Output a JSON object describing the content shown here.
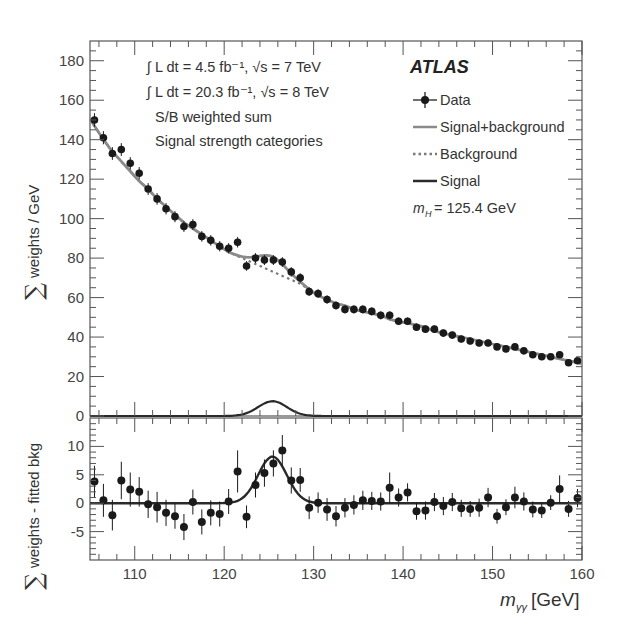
{
  "chart_data": [
    {
      "type": "scatter",
      "panel": "main",
      "title": "",
      "xlabel": "m_γγ [GeV]",
      "ylabel": "∑ weights / GeV",
      "xlim": [
        105,
        160
      ],
      "ylim": [
        0,
        190
      ],
      "yticks": [
        0,
        20,
        40,
        60,
        80,
        100,
        120,
        140,
        160,
        180
      ],
      "xticks": [
        110,
        120,
        130,
        140,
        150,
        160
      ],
      "grid": false,
      "annotations": [
        "∫ L dt = 4.5 fb⁻¹, √s = 7 TeV",
        "∫ L dt = 20.3 fb⁻¹, √s = 8 TeV",
        "S/B weighted sum",
        "Signal strength categories",
        "ATLAS",
        "m_H = 125.4 GeV"
      ],
      "legend": [
        "Data",
        "Signal+background",
        "Background",
        "Signal"
      ],
      "legend_position": "upper right",
      "x": [
        105.5,
        106.5,
        107.5,
        108.5,
        109.5,
        110.5,
        111.5,
        112.5,
        113.5,
        114.5,
        115.5,
        116.5,
        117.5,
        118.5,
        119.5,
        120.5,
        121.5,
        122.5,
        123.5,
        124.5,
        125.5,
        126.5,
        127.5,
        128.5,
        129.5,
        130.5,
        131.5,
        132.5,
        133.5,
        134.5,
        135.5,
        136.5,
        137.5,
        138.5,
        139.5,
        140.5,
        141.5,
        142.5,
        143.5,
        144.5,
        145.5,
        146.5,
        147.5,
        148.5,
        149.5,
        150.5,
        151.5,
        152.5,
        153.5,
        154.5,
        155.5,
        156.5,
        157.5,
        158.5,
        159.5
      ],
      "series": [
        {
          "name": "Data",
          "values": [
            150,
            141,
            133,
            135,
            128,
            123,
            115,
            110,
            105,
            101,
            96,
            97,
            91,
            89,
            86,
            85,
            88,
            76,
            80,
            79,
            79,
            78,
            73,
            70,
            63,
            62,
            59,
            56,
            54,
            54,
            54,
            53,
            51,
            51,
            48,
            48,
            45,
            44,
            44,
            42,
            41,
            39,
            38,
            37,
            37,
            35,
            34,
            35,
            33,
            31,
            30,
            30,
            31,
            27,
            28
          ]
        },
        {
          "name": "Signal+background",
          "values": [
            147,
            140,
            134,
            129,
            124,
            119,
            115,
            110,
            106,
            102,
            98,
            95,
            92,
            89,
            86,
            83,
            81,
            80,
            80,
            80,
            80,
            80,
            77,
            72,
            64,
            61,
            59,
            57,
            56,
            54,
            53,
            52,
            51,
            49,
            48,
            47,
            46,
            45,
            43,
            42,
            41,
            40,
            39,
            38,
            37,
            36,
            35,
            34,
            33,
            32,
            31,
            30,
            29,
            28,
            27
          ]
        },
        {
          "name": "Background",
          "values": [
            147,
            140,
            134,
            129,
            124,
            119,
            115,
            110,
            106,
            102,
            98,
            95,
            92,
            89,
            86,
            83,
            81,
            79,
            77,
            75,
            73,
            71,
            69,
            67,
            64,
            61,
            59,
            57,
            56,
            54,
            53,
            52,
            51,
            49,
            48,
            47,
            46,
            45,
            43,
            42,
            41,
            40,
            39,
            38,
            37,
            36,
            35,
            34,
            33,
            32,
            31,
            30,
            29,
            28,
            27
          ]
        },
        {
          "name": "Signal",
          "values": [
            0,
            0,
            0,
            0,
            0,
            0,
            0,
            0,
            0,
            0,
            0,
            0,
            0,
            0,
            0,
            0,
            0.1,
            0.5,
            2,
            5,
            7.5,
            6.5,
            3,
            0.8,
            0.1,
            0,
            0,
            0,
            0,
            0,
            0,
            0,
            0,
            0,
            0,
            0,
            0,
            0,
            0,
            0,
            0,
            0,
            0,
            0,
            0,
            0,
            0,
            0,
            0,
            0,
            0,
            0,
            0,
            0,
            0
          ]
        }
      ]
    },
    {
      "type": "scatter",
      "panel": "residual",
      "xlabel": "m_γγ [GeV]",
      "ylabel": "∑ weights - fitted bkg",
      "xlim": [
        105,
        160
      ],
      "ylim": [
        -10,
        15
      ],
      "yticks": [
        -5,
        0,
        5,
        10
      ],
      "xticks": [
        110,
        120,
        130,
        140,
        150,
        160
      ],
      "x": [
        105.5,
        106.5,
        107.5,
        108.5,
        109.5,
        110.5,
        111.5,
        112.5,
        113.5,
        114.5,
        115.5,
        116.5,
        117.5,
        118.5,
        119.5,
        120.5,
        121.5,
        122.5,
        123.5,
        124.5,
        125.5,
        126.5,
        127.5,
        128.5,
        129.5,
        130.5,
        131.5,
        132.5,
        133.5,
        134.5,
        135.5,
        136.5,
        137.5,
        138.5,
        139.5,
        140.5,
        141.5,
        142.5,
        143.5,
        144.5,
        145.5,
        146.5,
        147.5,
        148.5,
        149.5,
        150.5,
        151.5,
        152.5,
        153.5,
        154.5,
        155.5,
        156.5,
        157.5,
        158.5,
        159.5
      ],
      "series": [
        {
          "name": "Data",
          "values": [
            3.8,
            0.5,
            -2.1,
            4,
            2.4,
            2,
            -0.2,
            -0.7,
            -1.7,
            -2.3,
            -4.2,
            0.2,
            -3.3,
            -1.7,
            -1.9,
            0.3,
            5.6,
            -2.4,
            3.2,
            5.3,
            7,
            9.3,
            4,
            4.1,
            -0.8,
            0.1,
            -1.1,
            -2.3,
            -0.8,
            -0.3,
            0.5,
            0.4,
            0.3,
            2.7,
            1,
            1.9,
            -1.4,
            -1.3,
            0.2,
            -0.5,
            0.2,
            -0.9,
            -1,
            -0.8,
            1,
            -2.3,
            -0.7,
            1,
            0.3,
            -1.1,
            -1.3,
            0.1,
            2.5,
            -1,
            0.9
          ]
        },
        {
          "name": "Signal",
          "values": [
            0,
            0,
            0,
            0,
            0,
            0,
            0,
            0,
            0,
            0,
            0,
            0,
            0,
            0,
            0,
            0,
            0.1,
            0.5,
            2,
            5,
            7.8,
            7,
            3.2,
            0.8,
            0.1,
            0,
            0,
            0,
            0,
            0,
            0,
            0,
            0,
            0,
            0,
            0,
            0,
            0,
            0,
            0,
            0,
            0,
            0,
            0,
            0,
            0,
            0,
            0,
            0,
            0,
            0,
            0,
            0,
            0,
            0
          ]
        }
      ],
      "errors": [
        2.8,
        2.9,
        2.7,
        3.3,
        3,
        2.6,
        2.4,
        2.7,
        2.3,
        2.2,
        2.3,
        2.2,
        2.2,
        2.2,
        2.2,
        2.2,
        3.7,
        2,
        2.2,
        2.4,
        2.3,
        2.7,
        2.3,
        2.1,
        2,
        1.8,
        2,
        1.8,
        1.7,
        1.7,
        1.7,
        1.6,
        1.6,
        2.7,
        1.6,
        1.6,
        1.5,
        1.6,
        1.6,
        1.6,
        1.6,
        1.5,
        1.4,
        1.6,
        1.7,
        1.3,
        1.4,
        1.9,
        1.6,
        1.4,
        1.3,
        1.3,
        2.4,
        1.4,
        1.6
      ]
    }
  ],
  "labels": {
    "atlas": "ATLAS",
    "lumi1": "∫ L dt = 4.5 fb⁻¹, √s = 7 TeV",
    "lumi2": "∫ L dt = 20.3 fb⁻¹, √s = 8 TeV",
    "sb": "S/B weighted sum",
    "cat": "Signal strength categories",
    "legend_data": "Data",
    "legend_sb": "Signal+background",
    "legend_bkg": "Background",
    "legend_sig": "Signal",
    "mass": "= 125.4 GeV",
    "ylabel_main": "weights / GeV",
    "ylabel_res": "weights - fitted bkg",
    "xlabel_unit": "[GeV]"
  },
  "colors": {
    "data": "#1a1a1a",
    "sb": "#8a8a8a",
    "bkg": "#7a7a7a",
    "signal": "#2a2a2a",
    "axis": "#555"
  }
}
